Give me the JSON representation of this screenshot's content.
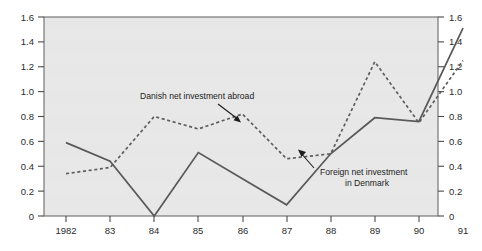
{
  "chart_data": {
    "type": "line",
    "title": "",
    "subtitle": "",
    "xlabel": "",
    "ylabel": "",
    "x": [
      1982,
      1983,
      1984,
      1985,
      1986,
      1987,
      1988,
      1989,
      1990,
      1991
    ],
    "categories": [
      "1982",
      "83",
      "84",
      "85",
      "86",
      "87",
      "88",
      "89",
      "90",
      "91"
    ],
    "xtick_labels": [
      "1982",
      "83",
      "84",
      "85",
      "86",
      "87",
      "88",
      "89",
      "90",
      "91"
    ],
    "ytick_labels": [
      "0",
      "0.2",
      "0.4",
      "0.6",
      "0.8",
      "1.0",
      "1.2",
      "1.4",
      "1.6"
    ],
    "ytick_values": [
      0,
      0.2,
      0.4,
      0.6,
      0.8,
      1.0,
      1.2,
      1.4,
      1.6
    ],
    "ylim": [
      0,
      1.6
    ],
    "ylim_right": [
      0,
      1.6
    ],
    "right_axis": true,
    "right_ytick_labels": [
      "0",
      "0.2",
      "0.4",
      "0.6",
      "0.8",
      "1.0",
      "1.2",
      "1.4",
      "1.6"
    ],
    "grid": false,
    "legend": "annotations",
    "legend_position": "inside-annotated",
    "plot_background": "#e7e7e7",
    "series": [
      {
        "name": "Danish net investment abroad",
        "style": "dashed",
        "color": "#5e5e5e",
        "values": [
          0.34,
          0.39,
          0.8,
          0.7,
          0.82,
          0.46,
          0.5,
          1.24,
          0.75,
          1.25
        ]
      },
      {
        "name": "Foreign net investment in Denmark",
        "style": "solid",
        "color": "#595959",
        "values": [
          0.59,
          0.44,
          0.0,
          0.51,
          0.3,
          0.09,
          0.5,
          0.79,
          0.76,
          1.51
        ]
      }
    ],
    "annotations": [
      {
        "id": "danish-label",
        "text": "Danish net investment abroad",
        "lines": [
          "Danish net investment abroad"
        ],
        "points_to_series": "Danish net investment abroad"
      },
      {
        "id": "foreign-label",
        "text": "Foreign net investment in Denmark",
        "lines": [
          "Foreign net investment",
          "in Denmark"
        ],
        "points_to_series": "Foreign net investment in Denmark"
      }
    ]
  }
}
